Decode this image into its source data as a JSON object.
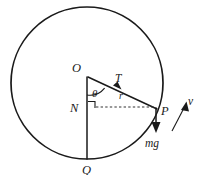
{
  "figure": {
    "background_color": "#ffffff",
    "ink_color": "#1a1a1a",
    "width": 201,
    "height": 175
  },
  "labels": {
    "center": "O",
    "foot": "N",
    "bottom": "Q",
    "particle": "P",
    "tension": "T",
    "radius": "r",
    "angle": "θ",
    "velocity": "v",
    "weight": "mg"
  },
  "geometry": {
    "circle": {
      "cx": 87,
      "cy": 83,
      "r": 76
    },
    "points": {
      "O": {
        "x": 87,
        "y": 76
      },
      "N": {
        "x": 87,
        "y": 107
      },
      "Q": {
        "x": 87,
        "y": 159
      },
      "P": {
        "x": 156,
        "y": 108
      }
    },
    "angle_theta_degrees": 65,
    "right_angle_at": "N"
  },
  "vectors": [
    {
      "name": "tension",
      "label": "T",
      "from": "P",
      "toward": "O",
      "description": "tension along string toward centre"
    },
    {
      "name": "weight",
      "label": "mg",
      "direction": "down",
      "description": "gravitational force at P"
    },
    {
      "name": "velocity",
      "label": "v",
      "direction": "up-right",
      "description": "tangential velocity at P"
    }
  ]
}
